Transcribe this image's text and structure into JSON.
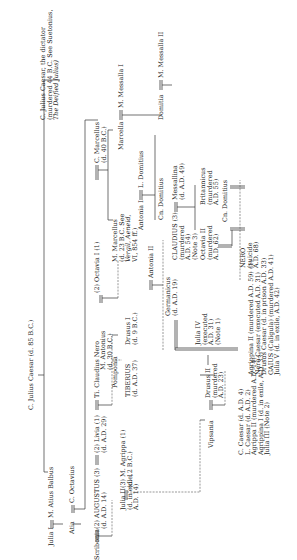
{
  "people": {
    "c_julius_caesar_elder": {
      "name": "C. Julius Caesar",
      "note": "(d. 85 B.C.)"
    },
    "julius_caesar_dictator": {
      "name": "C. Julius Caesar, the dictator",
      "line2": "(murdered 44 B.C. See Suetonius,",
      "line3": "The Deified Julius)"
    },
    "julia_i": {
      "name": "Julia I"
    },
    "atius_balbus": {
      "name": "M. Atius Balbus"
    },
    "atia": {
      "name": "Atia"
    },
    "c_octavius": {
      "name": "C. Octavius"
    },
    "scribonia": {
      "name": "Scribonia"
    },
    "augustus": {
      "name": "(2) AUGUSTUS (3)",
      "note": "(d. A.D. 14)"
    },
    "livia": {
      "name": "(2) Livia (1)",
      "note": "(d. A.D. 29)"
    },
    "claudius_nero": {
      "name": "Ti. Claudius Nero"
    },
    "antonius": {
      "name": "M. Antonius",
      "note": "(d. 30 B.C.)"
    },
    "octavia_i": {
      "name": "(2) Octavia I (1)"
    },
    "c_marcellus": {
      "name": "C. Marcellus",
      "note": "(d. 40 B.C.)"
    },
    "marcella": {
      "name": "Marcella"
    },
    "messalla_i": {
      "name": "M. Messalla I"
    },
    "m_marcellus": {
      "name": "M. Marcellus",
      "line2": "(d. 23 B.C. See",
      "line3": "Vergil, Aeneid,",
      "line4": "VI, 854 ff.)"
    },
    "antonia_i": {
      "name": "Antonia I"
    },
    "l_domitius": {
      "name": "L. Domitius"
    },
    "domitia": {
      "name": "Domitia"
    },
    "messalla_ii": {
      "name": "M. Messalla II"
    },
    "cn_domitius": {
      "name": "Cn. Domitius"
    },
    "claudius": {
      "name": "CLAUDIUS (3)",
      "line2": "(murdered",
      "line3": "A.D. 54)",
      "line4": "(Note 3)"
    },
    "messallina": {
      "name": "Messallina",
      "note": "(d. A.D. 49)"
    },
    "octavia_ii": {
      "name": "Octavia II",
      "line2": "(murdered",
      "line3": "A.D. 62)"
    },
    "britannicus": {
      "name": "Britannicus",
      "line2": "(murdered",
      "line3": "A.D. 55)"
    },
    "julia_ii": {
      "name": "Julia II",
      "line2": "(d. in exile,",
      "line3": "A.D. 14)"
    },
    "agrippa": {
      "name": "(3) M. Agrippa (1)",
      "note": "(d. 12 B.C.)"
    },
    "pomponia": {
      "name": "Pomponia"
    },
    "tiberius": {
      "name": "TIBERIUS",
      "note": "(d. A.D. 37)"
    },
    "drusus_i": {
      "name": "Drusus I",
      "note": "(d. 9 B.C.)"
    },
    "antonia_ii": {
      "name": "Antonia II"
    },
    "germanicus": {
      "name": "Germanicus",
      "note": "(d. A.D. 19)"
    },
    "vipsania": {
      "name": "Vipsania"
    },
    "drusus_ii": {
      "name": "Drusus II",
      "line2": "(murdered",
      "line3": "A.D. 23)"
    },
    "julia_iv": {
      "name": "Julia IV",
      "line2": "(executed",
      "line3": "A.D. 31)",
      "line4": "(Note 1)"
    },
    "nero": {
      "name": "NERO",
      "line2": "(suicide",
      "line3": "A.D. 68)"
    },
    "agrippa_children": [
      "C. Caesar (d. A.D. 4)",
      "L. Caesar (d. A.D. 2)",
      "Agrippa II (murdered A.D. 14)",
      "Agrippina I (d. in exile, A.D. 33)",
      "Julia III (Note 2)"
    ],
    "germanicus_children": [
      "Agrippina II (murdered A.D. 59) (1)",
      "Nero Caesar (executed A.D. 31)",
      "Drusus Caesar (d. in prison A.D. 33)",
      "GAIUS (Caligula) (murdered A.D. 41)",
      "Julia V (d. in exile, A.D. 42)"
    ]
  }
}
